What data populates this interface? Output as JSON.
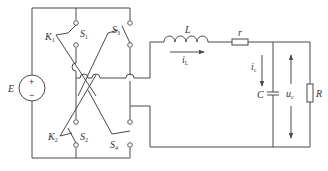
{
  "diagram": {
    "type": "circuit-schematic",
    "colors": {
      "line": "#4a4a4a",
      "text": "#333333",
      "background": "#ffffff"
    },
    "source": {
      "label": "E",
      "plus": "+",
      "minus": "−"
    },
    "switches": [
      {
        "label": "S",
        "sub": "1"
      },
      {
        "label": "S",
        "sub": "2"
      },
      {
        "label": "S",
        "sub": "3"
      },
      {
        "label": "S",
        "sub": "4"
      }
    ],
    "links": [
      {
        "label": "K",
        "sub": "1"
      },
      {
        "label": "K",
        "sub": "2"
      }
    ],
    "inductor": {
      "label": "L"
    },
    "series_resistor": {
      "label": "r"
    },
    "inductor_current": {
      "label": "i",
      "sub": "L"
    },
    "capacitor": {
      "label": "C"
    },
    "capacitor_current": {
      "label": "i",
      "sub": "c"
    },
    "output_voltage": {
      "label": "u",
      "sub": "c"
    },
    "load": {
      "label": "R"
    }
  }
}
